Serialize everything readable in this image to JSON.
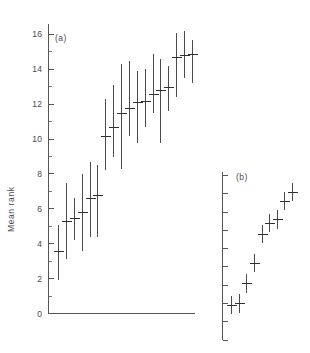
{
  "figure": {
    "ylabel": "Mean rank",
    "panel_a_label": "(a)",
    "panel_b_label": "(b)",
    "y_tick_labels": [
      "16",
      "14",
      "12",
      "10",
      "8",
      "6",
      "4",
      "2",
      "0"
    ]
  },
  "chart_data": [
    {
      "type": "scatter",
      "id": "panel-a",
      "title": "(a)",
      "xlabel": "",
      "ylabel": "Mean rank",
      "ylim": [
        0,
        16.6
      ],
      "xlim": [
        0,
        19
      ],
      "grid": false,
      "legend": null,
      "y_ticks_major": [
        0,
        2,
        4,
        6,
        8,
        10,
        12,
        14,
        16
      ],
      "y_ticks_minor": [
        1,
        3,
        5,
        7,
        9,
        11,
        13,
        15
      ],
      "y_tick_labels": [
        "0",
        "2",
        "4",
        "6",
        "8",
        "10",
        "12",
        "14",
        "16"
      ],
      "x": [
        1,
        2,
        3,
        4,
        5,
        6,
        7,
        8,
        9,
        10,
        11,
        12,
        13,
        14,
        15,
        16,
        17,
        18
      ],
      "values": [
        3.6,
        5.3,
        5.5,
        5.8,
        6.6,
        6.8,
        10.2,
        10.7,
        11.5,
        11.8,
        12.1,
        12.2,
        12.6,
        12.8,
        13.0,
        14.7,
        14.8,
        14.9
      ],
      "err_low": [
        1.9,
        3.1,
        4.2,
        3.6,
        4.4,
        4.4,
        8.2,
        9.0,
        8.3,
        10.2,
        9.8,
        10.7,
        11.5,
        9.8,
        11.6,
        12.4,
        13.5,
        13.2
      ],
      "err_high": [
        5.1,
        7.5,
        6.6,
        8.0,
        8.7,
        8.5,
        12.3,
        13.1,
        14.3,
        14.5,
        13.9,
        14.0,
        14.9,
        14.6,
        14.2,
        16.1,
        16.2,
        15.7
      ],
      "marker": "horizontal-tick-with-vertical-range"
    },
    {
      "type": "scatter",
      "id": "panel-b",
      "title": "(b)",
      "xlabel": "",
      "ylabel": "Mean rank",
      "ylim": [
        0,
        9.2
      ],
      "xlim": [
        0,
        10
      ],
      "grid": false,
      "legend": null,
      "y_ticks_major": [
        0,
        1,
        2,
        3,
        4,
        5,
        6,
        7,
        8,
        9
      ],
      "y_ticks_minor": [],
      "y_tick_labels": [],
      "x": [
        1,
        2,
        3,
        4,
        5,
        6,
        7,
        8,
        9
      ],
      "values": [
        1.9,
        2.0,
        3.1,
        4.2,
        5.8,
        6.4,
        6.6,
        7.6,
        8.1
      ],
      "err_low": [
        1.4,
        1.5,
        2.6,
        3.7,
        5.3,
        5.9,
        6.1,
        7.1,
        7.6
      ],
      "err_high": [
        2.4,
        2.5,
        3.6,
        4.7,
        6.3,
        6.9,
        7.1,
        8.1,
        8.6
      ],
      "marker": "horizontal-tick-with-vertical-range"
    }
  ]
}
